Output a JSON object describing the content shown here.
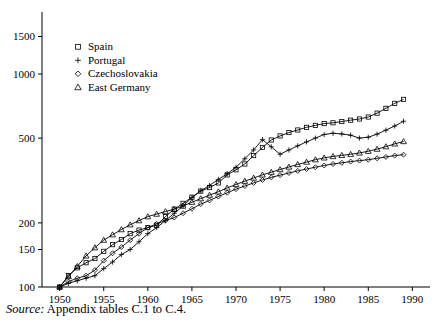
{
  "figure": {
    "source_note_prefix": "Source:",
    "source_note_text": " Appendix tables C.1 to C.4."
  },
  "chart_data": {
    "type": "line",
    "title": "",
    "xlabel": "",
    "ylabel": "",
    "yscale": "log",
    "xlim": [
      1948,
      1992
    ],
    "ylim": [
      100,
      1700
    ],
    "grid": false,
    "legend_position": "top-left",
    "yticks": [
      100,
      150,
      200,
      500,
      1000,
      1500
    ],
    "ytick_labels": [
      "100",
      "150",
      "200",
      "500",
      "1000",
      "1500"
    ],
    "xticks": [
      1950,
      1955,
      1960,
      1965,
      1970,
      1975,
      1980,
      1985,
      1990
    ],
    "xtick_labels": [
      "1950",
      "1955",
      "1960",
      "1965",
      "1970",
      "1975",
      "1980",
      "1985",
      "1990"
    ],
    "x": [
      1950,
      1951,
      1952,
      1953,
      1954,
      1955,
      1956,
      1957,
      1958,
      1959,
      1960,
      1961,
      1962,
      1963,
      1964,
      1965,
      1966,
      1967,
      1968,
      1969,
      1970,
      1971,
      1972,
      1973,
      1974,
      1975,
      1976,
      1977,
      1978,
      1979,
      1980,
      1981,
      1982,
      1983,
      1984,
      1985,
      1986,
      1987,
      1988,
      1989
    ],
    "series": [
      {
        "name": "Spain",
        "marker": "square",
        "values": [
          100,
          113,
          123,
          130,
          136,
          147,
          158,
          167,
          178,
          185,
          190,
          195,
          214,
          232,
          247,
          264,
          282,
          293,
          308,
          336,
          355,
          378,
          414,
          452,
          490,
          512,
          531,
          546,
          562,
          574,
          585,
          590,
          598,
          607,
          615,
          628,
          655,
          690,
          728,
          760
        ]
      },
      {
        "name": "Portugal",
        "marker": "plus",
        "values": [
          100,
          104,
          107,
          110,
          113,
          122,
          131,
          142,
          150,
          163,
          178,
          190,
          205,
          222,
          240,
          263,
          283,
          300,
          320,
          340,
          365,
          400,
          440,
          492,
          455,
          420,
          440,
          460,
          480,
          500,
          520,
          527,
          523,
          516,
          500,
          505,
          522,
          545,
          570,
          600
        ]
      },
      {
        "name": "Czechoslovakia",
        "marker": "diamond",
        "values": [
          100,
          106,
          110,
          113,
          120,
          133,
          144,
          154,
          166,
          178,
          190,
          198,
          205,
          212,
          222,
          233,
          245,
          255,
          266,
          277,
          288,
          298,
          308,
          318,
          327,
          335,
          343,
          351,
          358,
          365,
          372,
          378,
          383,
          388,
          392,
          396,
          402,
          408,
          414,
          418
        ]
      },
      {
        "name": "East Germany",
        "marker": "triangle",
        "values": [
          100,
          112,
          125,
          140,
          153,
          166,
          176,
          186,
          196,
          205,
          214,
          220,
          226,
          232,
          240,
          250,
          260,
          270,
          280,
          292,
          303,
          314,
          325,
          336,
          346,
          356,
          366,
          376,
          386,
          396,
          404,
          410,
          415,
          420,
          426,
          434,
          444,
          456,
          470,
          482
        ]
      }
    ],
    "legend_entries": [
      {
        "label": "Spain",
        "marker": "square"
      },
      {
        "label": "Portugal",
        "marker": "plus"
      },
      {
        "label": "Czechoslovakia",
        "marker": "diamond"
      },
      {
        "label": "East Germany",
        "marker": "triangle"
      }
    ]
  }
}
